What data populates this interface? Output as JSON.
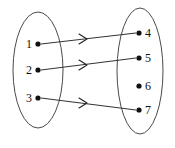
{
  "figure": {
    "background_color": "#ffffff",
    "ink_color": "#111111",
    "ellipse_stroke_color": "#4a4a4a",
    "line_color": "#333333",
    "width": 175,
    "height": 148
  },
  "sets": {
    "domain": {
      "name": "domain-set",
      "ellipse": {
        "cx": 38,
        "cy": 70,
        "rx": 25,
        "ry": 58
      },
      "elements": [
        {
          "id": "node-1",
          "label": "1",
          "dot_x": 38,
          "dot_y": 44,
          "label_x": 32,
          "label_y": 48
        },
        {
          "id": "node-2",
          "label": "2",
          "dot_x": 38,
          "dot_y": 70,
          "label_x": 32,
          "label_y": 74
        },
        {
          "id": "node-3",
          "label": "3",
          "dot_x": 38,
          "dot_y": 98,
          "label_x": 32,
          "label_y": 102
        }
      ]
    },
    "codomain": {
      "name": "codomain-set",
      "ellipse": {
        "cx": 140,
        "cy": 71,
        "rx": 23,
        "ry": 63
      },
      "elements": [
        {
          "id": "node-4",
          "label": "4",
          "dot_x": 139,
          "dot_y": 33,
          "label_x": 145,
          "label_y": 37
        },
        {
          "id": "node-5",
          "label": "5",
          "dot_x": 139,
          "dot_y": 58,
          "label_x": 145,
          "label_y": 62
        },
        {
          "id": "node-6",
          "label": "6",
          "dot_x": 139,
          "dot_y": 86,
          "label_x": 145,
          "label_y": 90
        },
        {
          "id": "node-7",
          "label": "7",
          "dot_x": 139,
          "dot_y": 110,
          "label_x": 145,
          "label_y": 114
        }
      ]
    }
  },
  "mappings": [
    {
      "id": "arrow-1-to-4",
      "from": "1",
      "to": "4",
      "x1": 41,
      "y1": 44,
      "x2": 136,
      "y2": 33,
      "arrow_x": 83,
      "arrow_y": 39
    },
    {
      "id": "arrow-2-to-5",
      "from": "2",
      "to": "5",
      "x1": 41,
      "y1": 70,
      "x2": 136,
      "y2": 58,
      "arrow_x": 83,
      "arrow_y": 65
    },
    {
      "id": "arrow-3-to-7",
      "from": "3",
      "to": "7",
      "x1": 41,
      "y1": 98,
      "x2": 136,
      "y2": 110,
      "arrow_x": 83,
      "arrow_y": 103
    }
  ],
  "unmapped_codomain_elements": [
    "6"
  ]
}
